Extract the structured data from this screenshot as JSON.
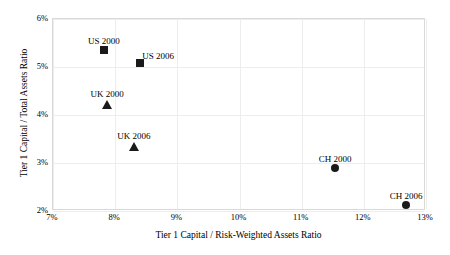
{
  "chart_data": {
    "type": "scatter",
    "title": "",
    "xlabel": "Tier 1 Capital / Risk-Weighted Assets Ratio",
    "ylabel": "Tier 1 Capital / Total Assets Ratio",
    "xlim": [
      7,
      13
    ],
    "ylim": [
      2,
      6
    ],
    "xtick_labels": [
      "7%",
      "8%",
      "9%",
      "10%",
      "11%",
      "12%",
      "13%"
    ],
    "xtick_values": [
      7,
      8,
      9,
      10,
      11,
      12,
      13
    ],
    "ytick_labels": [
      "2%",
      "3%",
      "4%",
      "5%",
      "6%"
    ],
    "ytick_values": [
      2,
      3,
      4,
      5,
      6
    ],
    "grid": true,
    "legend": "none",
    "marker_color": "#1a1a1a",
    "points": [
      {
        "label": "US 2000",
        "x": 7.82,
        "y": 5.35,
        "marker": "square",
        "label_dx": 0,
        "label_dy": -14
      },
      {
        "label": "US 2006",
        "x": 8.4,
        "y": 5.08,
        "marker": "square",
        "label_dx": 18,
        "label_dy": -12
      },
      {
        "label": "UK 2000",
        "x": 7.87,
        "y": 4.22,
        "marker": "triangle",
        "label_dx": 0,
        "label_dy": -15
      },
      {
        "label": "UK 2006",
        "x": 8.3,
        "y": 3.35,
        "marker": "triangle",
        "label_dx": 0,
        "label_dy": -15
      },
      {
        "label": "CH 2000",
        "x": 11.54,
        "y": 2.9,
        "marker": "circle",
        "label_dx": 0,
        "label_dy": -14
      },
      {
        "label": "CH 2006",
        "x": 12.68,
        "y": 2.12,
        "marker": "circle",
        "label_dx": 0,
        "label_dy": -14
      }
    ]
  }
}
